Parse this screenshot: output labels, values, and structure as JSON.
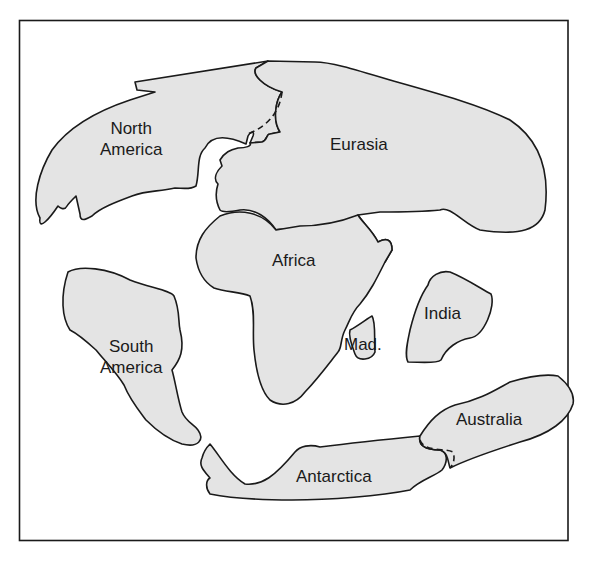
{
  "map": {
    "frame_color": "#1a1a1a",
    "land_fill": "#e4e4e4",
    "continents": [
      {
        "id": "north-america",
        "label": "North\nAmerica"
      },
      {
        "id": "eurasia",
        "label": "Eurasia"
      },
      {
        "id": "africa",
        "label": "Africa"
      },
      {
        "id": "south-america",
        "label": "South\nAmerica"
      },
      {
        "id": "madagascar",
        "label": "Mad."
      },
      {
        "id": "india",
        "label": "India"
      },
      {
        "id": "australia",
        "label": "Australia"
      },
      {
        "id": "antarctica",
        "label": "Antarctica"
      }
    ]
  }
}
